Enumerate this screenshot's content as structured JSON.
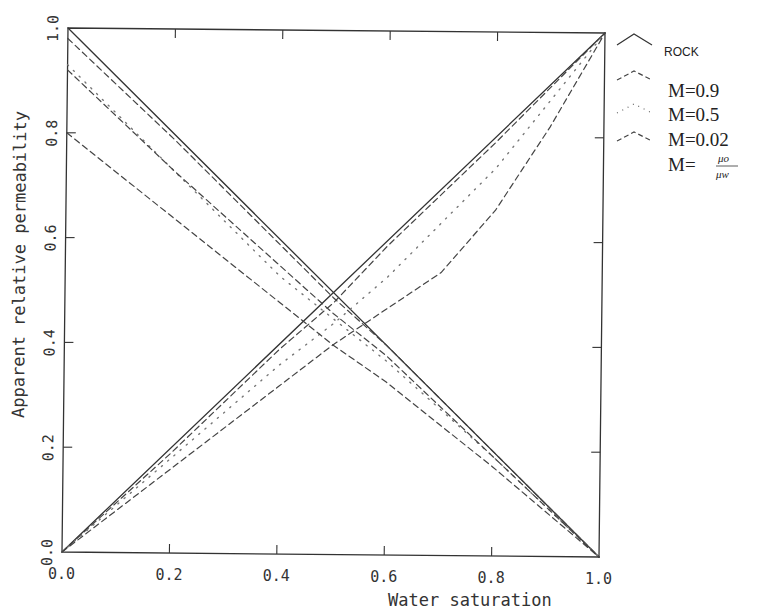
{
  "chart_data": {
    "type": "line",
    "title": "",
    "xlabel": "Water saturation",
    "ylabel": "Apparent relative permeability",
    "xlim": [
      0.0,
      1.0
    ],
    "ylim": [
      0.0,
      1.0
    ],
    "grid": false,
    "legend_position": "right-outside-top",
    "x_ticks": [
      "0.0",
      "0.2",
      "0.4",
      "0.6",
      "0.8",
      "1.0"
    ],
    "y_ticks": [
      "0.0",
      "0.2",
      "0.4",
      "0.6",
      "0.8",
      "1.0"
    ],
    "legend": [
      {
        "label": "ROCK",
        "style": "solid"
      },
      {
        "label": "M=0.9",
        "style": "dashed"
      },
      {
        "label": "M=0.5",
        "style": "dotted"
      },
      {
        "label": "M=0.02",
        "style": "dashed"
      },
      {
        "label": "M=",
        "fraction_num": "μo",
        "fraction_den": "μw",
        "style": "none"
      }
    ],
    "series": [
      {
        "name": "ROCK (oil)",
        "style": "solid",
        "x": [
          0.0,
          1.0
        ],
        "y": [
          1.0,
          0.0
        ]
      },
      {
        "name": "ROCK (water)",
        "style": "solid",
        "x": [
          0.0,
          1.0
        ],
        "y": [
          0.0,
          1.0
        ]
      },
      {
        "name": "M=0.9 (oil)",
        "style": "dashed",
        "x": [
          0.0,
          0.2,
          0.4,
          0.5,
          0.6,
          0.8,
          1.0
        ],
        "y": [
          0.98,
          0.79,
          0.59,
          0.49,
          0.4,
          0.2,
          0.0
        ]
      },
      {
        "name": "M=0.9 (water)",
        "style": "dashed",
        "x": [
          0.0,
          0.2,
          0.4,
          0.5,
          0.6,
          0.8,
          1.0
        ],
        "y": [
          0.0,
          0.19,
          0.39,
          0.48,
          0.59,
          0.79,
          1.0
        ]
      },
      {
        "name": "M=0.5 (oil)",
        "style": "dotted",
        "x": [
          0.0,
          0.2,
          0.4,
          0.5,
          0.6,
          0.8,
          1.0
        ],
        "y": [
          0.93,
          0.73,
          0.53,
          0.45,
          0.37,
          0.19,
          0.0
        ]
      },
      {
        "name": "M=0.5 (water)",
        "style": "dotted",
        "x": [
          0.0,
          0.2,
          0.4,
          0.5,
          0.6,
          0.8,
          1.0
        ],
        "y": [
          0.0,
          0.18,
          0.36,
          0.44,
          0.53,
          0.74,
          1.0
        ]
      },
      {
        "name": "M=0.02 (oil, upper)",
        "style": "dashed",
        "x": [
          0.0,
          0.2,
          0.4,
          0.5,
          0.6,
          0.8,
          1.0
        ],
        "y": [
          0.92,
          0.73,
          0.55,
          0.46,
          0.38,
          0.19,
          0.0
        ]
      },
      {
        "name": "M=0.02 (oil, lower)",
        "style": "dashed",
        "x": [
          0.0,
          0.2,
          0.4,
          0.5,
          0.6,
          0.7,
          0.8,
          1.0
        ],
        "y": [
          0.8,
          0.64,
          0.48,
          0.4,
          0.33,
          0.25,
          0.17,
          0.0
        ]
      },
      {
        "name": "M=0.02 (water)",
        "style": "dashed",
        "x": [
          0.0,
          0.2,
          0.4,
          0.5,
          0.6,
          0.7,
          0.8,
          0.9,
          1.0
        ],
        "y": [
          0.0,
          0.16,
          0.32,
          0.4,
          0.47,
          0.54,
          0.66,
          0.82,
          1.0
        ]
      }
    ]
  }
}
